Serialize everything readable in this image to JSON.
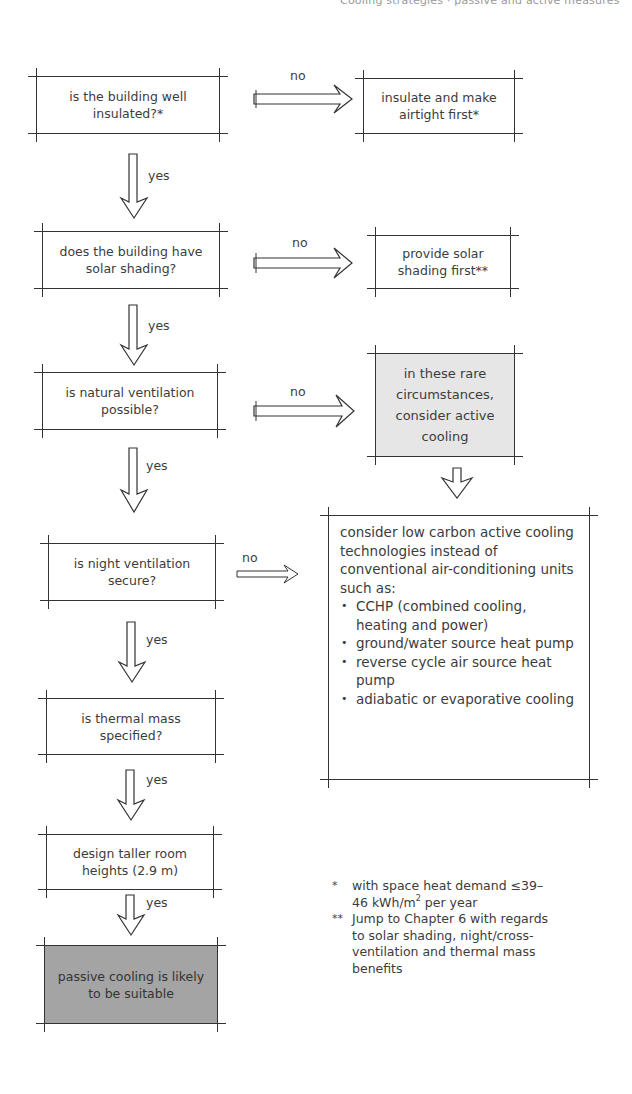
{
  "header": {
    "fragment": "Cooling strategies · passive and active measures"
  },
  "flowchart": {
    "questions": [
      {
        "id": "q1",
        "text": "is the building well insulated?*"
      },
      {
        "id": "q2",
        "text": "does the building have solar shading?"
      },
      {
        "id": "q3",
        "text": "is natural ventilation possible?"
      },
      {
        "id": "q4",
        "text": "is night ventilation secure?"
      },
      {
        "id": "q5",
        "text": "is thermal mass specified?"
      }
    ],
    "steps": {
      "taller_rooms": "design taller room heights (2.9 m)",
      "result_passive": "passive cooling is likely to be suitable"
    },
    "actions": {
      "insulate": "insulate and make airtight first*",
      "shading": "provide solar shading first**",
      "active_cooling": "in these rare circumstances, consider active cooling"
    },
    "low_carbon": {
      "intro": "consider low carbon active cooling technologies instead of conventional air-conditioning units such as:",
      "items": [
        "CCHP (combined cooling, heating and power)",
        "ground/water source heat pump",
        "reverse cycle air source heat pump",
        "adiabatic or evaporative cooling"
      ]
    },
    "labels": {
      "yes": "yes",
      "no": "no"
    }
  },
  "footnotes": [
    {
      "mark": "*",
      "text_before_sup": "with space heat demand ≤39–46 kWh/m",
      "sup": "2",
      "text_after_sup": " per year"
    },
    {
      "mark": "**",
      "text": "Jump to Chapter 6 with regards to solar shading, night/cross-ventilation and thermal mass benefits"
    }
  ],
  "colors": {
    "line": "#333333",
    "text": "#3c3c3c",
    "light_fill": "#e6e6e6",
    "dark_fill": "#a4a4a4",
    "background": "#ffffff"
  }
}
